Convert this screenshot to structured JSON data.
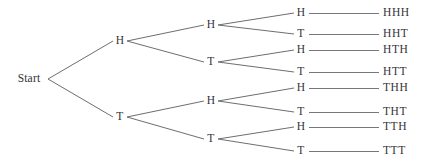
{
  "diagram": {
    "type": "tree",
    "colors": {
      "background": "#ffffff",
      "line": "#6e6e72",
      "text": "#333338"
    },
    "root": {
      "id": "root",
      "label": "Start",
      "x": 29,
      "y": 79,
      "branch_x": 48
    },
    "level1": [
      {
        "id": "h",
        "label": "H",
        "x": 120,
        "y": 41
      },
      {
        "id": "t",
        "label": "T",
        "x": 120,
        "y": 117
      }
    ],
    "level2": [
      {
        "id": "hh",
        "label": "H",
        "x": 211,
        "y": 25,
        "parent": "h"
      },
      {
        "id": "ht",
        "label": "T",
        "x": 211,
        "y": 62,
        "parent": "h"
      },
      {
        "id": "th",
        "label": "H",
        "x": 211,
        "y": 101,
        "parent": "t"
      },
      {
        "id": "tt",
        "label": "T",
        "x": 211,
        "y": 139,
        "parent": "t"
      }
    ],
    "level3": [
      {
        "id": "hhh",
        "label": "H",
        "x": 301,
        "y": 13,
        "parent": "hh"
      },
      {
        "id": "hht",
        "label": "T",
        "x": 301,
        "y": 34,
        "parent": "hh"
      },
      {
        "id": "hth",
        "label": "H",
        "x": 301,
        "y": 50,
        "parent": "ht"
      },
      {
        "id": "htt",
        "label": "T",
        "x": 301,
        "y": 72,
        "parent": "ht"
      },
      {
        "id": "thh",
        "label": "H",
        "x": 301,
        "y": 88,
        "parent": "th"
      },
      {
        "id": "tht",
        "label": "T",
        "x": 301,
        "y": 112,
        "parent": "th"
      },
      {
        "id": "tth",
        "label": "H",
        "x": 301,
        "y": 127,
        "parent": "tt"
      },
      {
        "id": "ttt",
        "label": "T",
        "x": 301,
        "y": 151,
        "parent": "tt"
      }
    ],
    "outcomes": [
      {
        "id": "out-hhh",
        "label": "HHH",
        "x": 383,
        "y": 13,
        "line_from": 309,
        "line_to": 379
      },
      {
        "id": "out-hht",
        "label": "HHT",
        "x": 383,
        "y": 34,
        "line_from": 309,
        "line_to": 379
      },
      {
        "id": "out-hth",
        "label": "HTH",
        "x": 383,
        "y": 50,
        "line_from": 309,
        "line_to": 379
      },
      {
        "id": "out-htt",
        "label": "HTT",
        "x": 383,
        "y": 72,
        "line_from": 309,
        "line_to": 379
      },
      {
        "id": "out-thh",
        "label": "THH",
        "x": 383,
        "y": 88,
        "line_from": 309,
        "line_to": 379
      },
      {
        "id": "out-tht",
        "label": "THT",
        "x": 383,
        "y": 112,
        "line_from": 309,
        "line_to": 379
      },
      {
        "id": "out-tth",
        "label": "TTH",
        "x": 383,
        "y": 127,
        "line_from": 309,
        "line_to": 379
      },
      {
        "id": "out-ttt",
        "label": "TTT",
        "x": 383,
        "y": 151,
        "line_from": 309,
        "line_to": 379
      }
    ]
  }
}
